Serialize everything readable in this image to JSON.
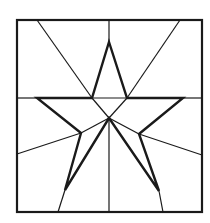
{
  "diagram": {
    "stroke_color": "#1a1a1a",
    "background": "#ffffff",
    "square": {
      "x1": 17,
      "y1": 20,
      "x2": 202,
      "y2": 212
    },
    "star_points": "109,42 127,98 183,98 139,134 159,191 109,118 65,190 81,133 37,98 92,98",
    "thin_lines": [
      {
        "x1": 109,
        "y1": 20,
        "x2": 109,
        "y2": 42
      },
      {
        "x1": 37,
        "y1": 20,
        "x2": 92,
        "y2": 98
      },
      {
        "x1": 180,
        "y1": 20,
        "x2": 127,
        "y2": 98
      },
      {
        "x1": 17,
        "y1": 98,
        "x2": 37,
        "y2": 98
      },
      {
        "x1": 183,
        "y1": 98,
        "x2": 202,
        "y2": 98
      },
      {
        "x1": 92,
        "y1": 98,
        "x2": 127,
        "y2": 98
      },
      {
        "x1": 17,
        "y1": 154,
        "x2": 81,
        "y2": 133
      },
      {
        "x1": 202,
        "y1": 155,
        "x2": 139,
        "y2": 134
      },
      {
        "x1": 58,
        "y1": 212,
        "x2": 65,
        "y2": 190
      },
      {
        "x1": 163,
        "y1": 212,
        "x2": 159,
        "y2": 191
      },
      {
        "x1": 109,
        "y1": 118,
        "x2": 109,
        "y2": 212
      },
      {
        "x1": 109,
        "y1": 118,
        "x2": 92,
        "y2": 98
      },
      {
        "x1": 109,
        "y1": 118,
        "x2": 127,
        "y2": 98
      },
      {
        "x1": 109,
        "y1": 118,
        "x2": 81,
        "y2": 133
      },
      {
        "x1": 109,
        "y1": 118,
        "x2": 139,
        "y2": 134
      }
    ]
  }
}
